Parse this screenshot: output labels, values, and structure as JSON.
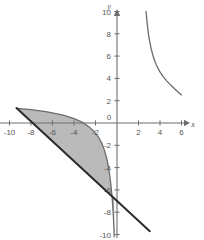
{
  "chart_data": {
    "type": "line",
    "title": "",
    "xlabel": "x",
    "ylabel": "y",
    "xlim": [
      -10.8,
      8.0
    ],
    "ylim": [
      -10.3,
      10.3
    ],
    "grid": false,
    "legend": "none",
    "x_ticks": [
      -10,
      -8,
      -6,
      -4,
      -2,
      0,
      2,
      4,
      6
    ],
    "x_tick_labels": [
      "-10",
      "-8",
      "-6",
      "-4",
      "-2",
      "0",
      "2",
      "4",
      "6"
    ],
    "y_ticks": [
      -10,
      -8,
      -6,
      -4,
      -2,
      2,
      4,
      6,
      8,
      10
    ],
    "y_tick_labels": [
      "-10",
      "-8",
      "-6",
      "-4",
      "-2",
      "2",
      "4",
      "6",
      "8",
      "10"
    ],
    "series": [
      {
        "name": "hyperbola-right-branch",
        "color": "#6b6b6b",
        "points": [
          [
            2.7,
            10.0
          ],
          [
            2.8,
            9.0
          ],
          [
            2.92,
            8.0
          ],
          [
            3.06,
            7.2
          ],
          [
            3.22,
            6.5
          ],
          [
            3.42,
            5.8
          ],
          [
            3.66,
            5.2
          ],
          [
            3.95,
            4.65
          ],
          [
            4.28,
            4.18
          ],
          [
            4.62,
            3.78
          ],
          [
            5.0,
            3.4
          ],
          [
            5.35,
            3.08
          ],
          [
            5.68,
            2.78
          ],
          [
            6.0,
            2.52
          ]
        ]
      },
      {
        "name": "hyperbola-left-branch",
        "color": "#6b6b6b",
        "points": [
          [
            -9.3,
            1.32
          ],
          [
            -8.0,
            1.2
          ],
          [
            -6.5,
            1.0
          ],
          [
            -5.0,
            0.7
          ],
          [
            -4.0,
            0.4
          ],
          [
            -3.2,
            0.05
          ],
          [
            -2.6,
            -0.35
          ],
          [
            -2.1,
            -0.8
          ],
          [
            -1.7,
            -1.3
          ],
          [
            -1.4,
            -1.85
          ],
          [
            -1.15,
            -2.5
          ],
          [
            -0.95,
            -3.2
          ],
          [
            -0.8,
            -3.95
          ],
          [
            -0.66,
            -4.8
          ],
          [
            -0.55,
            -5.7
          ],
          [
            -0.45,
            -6.7
          ],
          [
            -0.38,
            -7.7
          ],
          [
            -0.32,
            -8.7
          ],
          [
            -0.28,
            -9.6
          ],
          [
            -0.26,
            -10.2
          ]
        ]
      },
      {
        "name": "straight-line",
        "color": "#2b2b2b",
        "points": [
          [
            -9.35,
            1.35
          ],
          [
            3.05,
            -9.7
          ]
        ]
      }
    ],
    "shaded_region": {
      "name": "region-between-curve-and-line",
      "fill": "#a3a3a3",
      "opacity": 0.75,
      "description": "Region bounded above by the decreasing curve and below by the straight line"
    },
    "annotations": []
  },
  "colors": {
    "axis": "#6e6e6e",
    "tick_text": "#555555",
    "curve": "#6b6b6b",
    "line": "#2b2b2b",
    "shade": "#a3a3a3",
    "background": "#ffffff"
  }
}
